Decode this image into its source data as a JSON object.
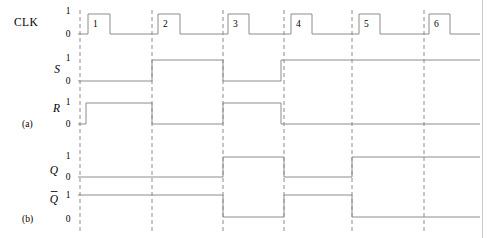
{
  "figure": {
    "type": "digital-timing-diagram",
    "width": 493,
    "height": 238,
    "background_color": "#ffffff",
    "wave_color": "#8c8c8c",
    "marker_color": "#8a8a8a",
    "marker_style": "dashed-vertical",
    "page_edge_color": "#c9c9c9"
  },
  "group_labels": {
    "a": "(a)",
    "b": "(b)"
  },
  "level_labels": {
    "high": "1",
    "low": "0"
  },
  "clock_pulse_numbers": [
    "1",
    "2",
    "3",
    "4",
    "5",
    "6"
  ],
  "signals": [
    {
      "id": "clk",
      "label": "CLK",
      "italic": false,
      "overbar": false,
      "group": "a",
      "y_high": 14,
      "y_low": 34,
      "label_x": 38,
      "label_y": 26,
      "level_x": 68,
      "level_high_y": 14,
      "level_low_y": 37
    },
    {
      "id": "s",
      "label": "S",
      "italic": true,
      "overbar": false,
      "group": "a",
      "y_high": 60,
      "y_low": 81,
      "label_x": 60,
      "label_y": 73,
      "level_x": 68,
      "level_high_y": 61,
      "level_low_y": 84
    },
    {
      "id": "r",
      "label": "R",
      "italic": true,
      "overbar": false,
      "group": "a",
      "y_high": 103,
      "y_low": 124,
      "label_x": 60,
      "label_y": 112,
      "level_x": 68,
      "level_high_y": 105,
      "level_low_y": 127
    },
    {
      "id": "q",
      "label": "Q",
      "italic": true,
      "overbar": false,
      "group": "b",
      "y_high": 157,
      "y_low": 177,
      "label_x": 58,
      "label_y": 174,
      "level_x": 68,
      "level_high_y": 159,
      "level_low_y": 180
    },
    {
      "id": "qbar",
      "label": "Q",
      "italic": true,
      "overbar": true,
      "group": "b",
      "y_high": 195,
      "y_low": 217,
      "label_x": 58,
      "label_y": 203,
      "level_x": 68,
      "level_high_y": 198,
      "level_low_y": 222
    }
  ],
  "chart_data": {
    "type": "line",
    "xlabel": "",
    "ylabel": "",
    "x_start": 78,
    "x_end": 480,
    "marker_x_positions": [
      80,
      152,
      223,
      284,
      352,
      424
    ],
    "series": [
      {
        "name": "CLK",
        "description": "Six positive clock pulses",
        "transitions": [
          {
            "x": 78,
            "level": 0
          },
          {
            "x": 88,
            "level": 1
          },
          {
            "x": 110,
            "level": 0
          },
          {
            "x": 158,
            "level": 1
          },
          {
            "x": 180,
            "level": 0
          },
          {
            "x": 228,
            "level": 1
          },
          {
            "x": 249,
            "level": 0
          },
          {
            "x": 291,
            "level": 1
          },
          {
            "x": 312,
            "level": 0
          },
          {
            "x": 359,
            "level": 1
          },
          {
            "x": 380,
            "level": 0
          },
          {
            "x": 429,
            "level": 1
          },
          {
            "x": 450,
            "level": 0
          },
          {
            "x": 480,
            "level": 0
          }
        ]
      },
      {
        "name": "S",
        "description": "Set input",
        "transitions": [
          {
            "x": 78,
            "level": 0
          },
          {
            "x": 152,
            "level": 1
          },
          {
            "x": 223,
            "level": 0
          },
          {
            "x": 281,
            "level": 1
          },
          {
            "x": 480,
            "level": 1
          }
        ]
      },
      {
        "name": "R",
        "description": "Reset input",
        "transitions": [
          {
            "x": 78,
            "level": 0
          },
          {
            "x": 86,
            "level": 1
          },
          {
            "x": 152,
            "level": 0
          },
          {
            "x": 223,
            "level": 1
          },
          {
            "x": 281,
            "level": 0
          },
          {
            "x": 480,
            "level": 0
          }
        ]
      },
      {
        "name": "Q",
        "description": "Flip-flop output",
        "transitions": [
          {
            "x": 78,
            "level": 0
          },
          {
            "x": 223,
            "level": 1
          },
          {
            "x": 284,
            "level": 0
          },
          {
            "x": 352,
            "level": 1
          },
          {
            "x": 480,
            "level": 1
          }
        ]
      },
      {
        "name": "Qbar",
        "description": "Complemented flip-flop output",
        "transitions": [
          {
            "x": 78,
            "level": 1
          },
          {
            "x": 223,
            "level": 0
          },
          {
            "x": 284,
            "level": 1
          },
          {
            "x": 352,
            "level": 0
          },
          {
            "x": 480,
            "level": 0
          }
        ]
      }
    ]
  }
}
